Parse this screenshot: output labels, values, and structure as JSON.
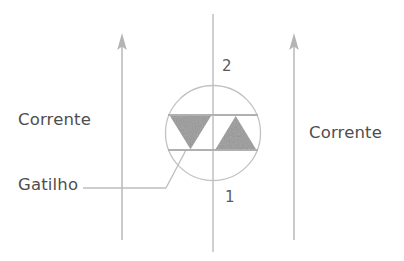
{
  "figure": {
    "background_color": "#ffffff",
    "ink_color": "#b4b4b4",
    "text_color": "#4e4e4e",
    "triangle_fill_color": "#a9a9a9"
  },
  "labels": {
    "corrente_left": "Corrente",
    "corrente_right": "Corrente",
    "gatilho": "Gatilho",
    "terminal_top": "2",
    "terminal_bottom": "1"
  },
  "diagram": {
    "type": "circuit-symbol",
    "component": "triac",
    "enclosure": "circle",
    "terminals": [
      {
        "name": "terminal-2",
        "label": "2",
        "position": "top"
      },
      {
        "name": "terminal-1",
        "label": "1",
        "position": "bottom"
      },
      {
        "name": "gate",
        "label": "Gatilho",
        "position": "lower-left"
      }
    ],
    "current_arrows": [
      {
        "name": "current-arrow-left",
        "direction": "up",
        "label": "Corrente"
      },
      {
        "name": "current-arrow-right",
        "direction": "up",
        "label": "Corrente"
      }
    ],
    "triangles": [
      {
        "name": "triangle-left",
        "orientation": "down"
      },
      {
        "name": "triangle-right",
        "orientation": "up"
      }
    ]
  }
}
